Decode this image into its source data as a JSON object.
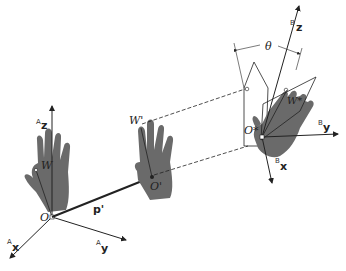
{
  "diagram": {
    "frame_a": {
      "axes": [
        {
          "prefix": "A",
          "name": "z"
        },
        {
          "prefix": "A",
          "name": "x"
        },
        {
          "prefix": "A",
          "name": "y"
        }
      ],
      "origin_label": "O",
      "point_label": "W"
    },
    "translated_frame": {
      "origin_label": "O'",
      "point_label": "W'"
    },
    "vector_label": "p'",
    "frame_b": {
      "axes": [
        {
          "prefix": "B",
          "name": "z"
        },
        {
          "prefix": "B",
          "name": "y"
        },
        {
          "prefix": "B",
          "name": "x"
        }
      ],
      "origin_label": "O*",
      "point_label": "W*",
      "angle_label": "θ"
    },
    "colors": {
      "hand": "#6a6a6a",
      "line": "#222222"
    }
  }
}
